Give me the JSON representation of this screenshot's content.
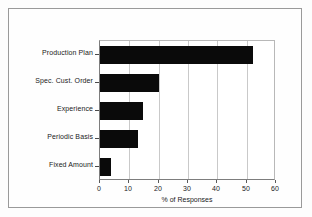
{
  "chart_data": {
    "type": "bar",
    "orientation": "horizontal",
    "title": "",
    "xlabel": "% of Responses",
    "ylabel": "",
    "categories": [
      "Production Plan",
      "Spec. Cust. Order",
      "Experience",
      "Periodic Basis",
      "Fixed Amount"
    ],
    "values": [
      52,
      20,
      14.5,
      13,
      3.7
    ],
    "xlim": [
      0,
      60
    ],
    "xticks": [
      0,
      10,
      20,
      30,
      40,
      50,
      60
    ],
    "xtick_labels": [
      "0",
      "10",
      "20",
      "30",
      "40",
      "50",
      "60"
    ],
    "grid": "vertical",
    "legend": "none",
    "bar_color": "#0a0a0a",
    "gridline_color": "#c9c9c9",
    "axis_color": "#7d7d7d",
    "background_color": "#ffffff"
  }
}
